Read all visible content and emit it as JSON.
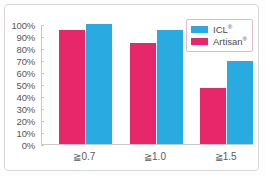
{
  "chart_data": {
    "type": "bar",
    "title": "",
    "subtitle": "",
    "xlabel": "",
    "ylabel": "",
    "categories": [
      "≧7.0",
      "≧1.0",
      "≧1.5"
    ],
    "category_labels": [
      "≧0.7",
      "≧1.0",
      "≧1.5"
    ],
    "series": [
      {
        "name": "Artisan®",
        "base_name": "Artisan",
        "mark": "®",
        "color": "#e8266a",
        "values": [
          95,
          84,
          47
        ]
      },
      {
        "name": "ICL®",
        "base_name": "ICL",
        "mark": "®",
        "color": "#29abe2",
        "values": [
          100,
          95,
          69
        ]
      }
    ],
    "legend_order": [
      "ICL®",
      "Artisan®"
    ],
    "legend": {
      "position": "top-right-inside",
      "entries": [
        {
          "label": "ICL",
          "mark": "®",
          "color": "#29abe2"
        },
        {
          "label": "Artisan",
          "mark": "®",
          "color": "#e8266a"
        }
      ]
    },
    "ylim": [
      0,
      100
    ],
    "ytick_step": 10,
    "ytick_labels": [
      "100%",
      "90%",
      "80%",
      "70%",
      "60%",
      "50%",
      "40%",
      "30%",
      "20%",
      "10%",
      "0%"
    ],
    "ytick_values": [
      100,
      90,
      80,
      70,
      60,
      50,
      40,
      30,
      20,
      10,
      0
    ],
    "yunit": "%",
    "grid": false,
    "axis_color": "#c9c9c9",
    "background": "#ffffff",
    "frame_color": "#d8d8d8"
  }
}
